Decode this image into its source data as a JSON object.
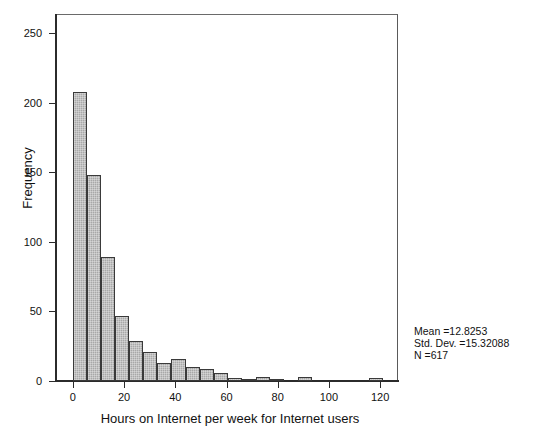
{
  "chart_data": {
    "type": "bar",
    "title": "",
    "subtitle": "",
    "xlabel": "Hours on Internet per week for Internet users",
    "ylabel": "Frequency",
    "xlim": [
      -7,
      127
    ],
    "ylim": [
      0,
      264
    ],
    "grid": false,
    "legend": null,
    "bin_width": 5.5,
    "x_ticks": [
      "0",
      "20",
      "40",
      "60",
      "80",
      "100",
      "120"
    ],
    "x_tick_values": [
      0,
      20,
      40,
      60,
      80,
      100,
      120
    ],
    "y_ticks": [
      "0",
      "50",
      "100",
      "150",
      "200",
      "250"
    ],
    "y_tick_values": [
      0,
      50,
      100,
      150,
      200,
      250
    ],
    "bar_fill_color": "#a8a8a8",
    "bar_edge_color": "#3a3a3a",
    "bins": [
      {
        "x0": 0.0,
        "x1": 5.5,
        "center": 2.75,
        "value": 208
      },
      {
        "x0": 5.5,
        "x1": 11.0,
        "center": 8.25,
        "value": 148
      },
      {
        "x0": 11.0,
        "x1": 16.5,
        "center": 13.75,
        "value": 89
      },
      {
        "x0": 16.5,
        "x1": 22.0,
        "center": 19.25,
        "value": 47
      },
      {
        "x0": 22.0,
        "x1": 27.5,
        "center": 24.75,
        "value": 29
      },
      {
        "x0": 27.5,
        "x1": 33.0,
        "center": 30.25,
        "value": 21
      },
      {
        "x0": 33.0,
        "x1": 38.5,
        "center": 35.75,
        "value": 13
      },
      {
        "x0": 38.5,
        "x1": 44.0,
        "center": 41.25,
        "value": 16
      },
      {
        "x0": 44.0,
        "x1": 49.5,
        "center": 46.75,
        "value": 10
      },
      {
        "x0": 49.5,
        "x1": 55.0,
        "center": 52.25,
        "value": 9
      },
      {
        "x0": 55.0,
        "x1": 60.5,
        "center": 57.75,
        "value": 6
      },
      {
        "x0": 60.5,
        "x1": 66.0,
        "center": 63.25,
        "value": 2
      },
      {
        "x0": 66.0,
        "x1": 71.5,
        "center": 68.75,
        "value": 1
      },
      {
        "x0": 71.5,
        "x1": 77.0,
        "center": 74.25,
        "value": 3
      },
      {
        "x0": 77.0,
        "x1": 82.5,
        "center": 79.75,
        "value": 1
      },
      {
        "x0": 88.0,
        "x1": 93.5,
        "center": 90.75,
        "value": 3
      },
      {
        "x0": 115.5,
        "x1": 121.0,
        "center": 118.25,
        "value": 2
      }
    ],
    "annotations": {
      "mean_label": "Mean =12.8253",
      "std_dev_label": "Std. Dev. =15.32088",
      "n_label": "N =617",
      "mean_value": 12.8253,
      "std_dev_value": 15.32088,
      "n_value": 617
    }
  }
}
